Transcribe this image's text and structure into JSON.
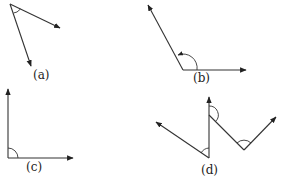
{
  "figure": {
    "type": "angle-diagrams",
    "panels": [
      {
        "id": "a",
        "label": "(a)",
        "description": "acute angle with arc marker"
      },
      {
        "id": "b",
        "label": "(b)",
        "description": "obtuse angle with arrowed arc marker"
      },
      {
        "id": "c",
        "label": "(c)",
        "description": "right angle with arc marker"
      },
      {
        "id": "d",
        "label": "(d)",
        "description": "zig-zag of rays forming three marked angles"
      }
    ]
  }
}
